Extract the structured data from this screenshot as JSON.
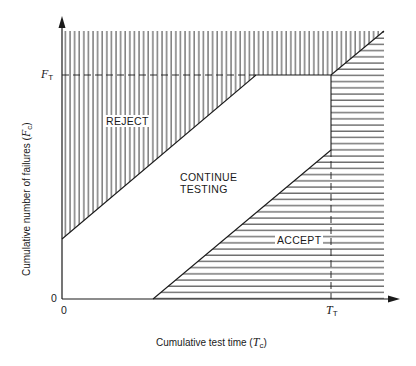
{
  "diagram": {
    "type": "sequential-test-decision-chart",
    "regions": {
      "reject": {
        "label": "REJECT",
        "hatch": "vertical"
      },
      "continue": {
        "label_line1": "CONTINUE",
        "label_line2": "TESTING",
        "hatch": "none"
      },
      "accept": {
        "label": "ACCEPT",
        "hatch": "horizontal"
      }
    },
    "axes": {
      "x": {
        "title_prefix": "Cumulative test time (",
        "title_var": "T",
        "title_sub": "c",
        "title_suffix": ")",
        "origin_label": "0",
        "marker_var": "T",
        "marker_sub": "T"
      },
      "y": {
        "title_prefix": "Cumulative number of failures (",
        "title_var": "F",
        "title_sub": "c",
        "title_suffix": ")",
        "origin_label": "0",
        "marker_var": "F",
        "marker_sub": "T"
      }
    },
    "colors": {
      "line": "#1a1a1a",
      "background": "#ffffff"
    }
  }
}
